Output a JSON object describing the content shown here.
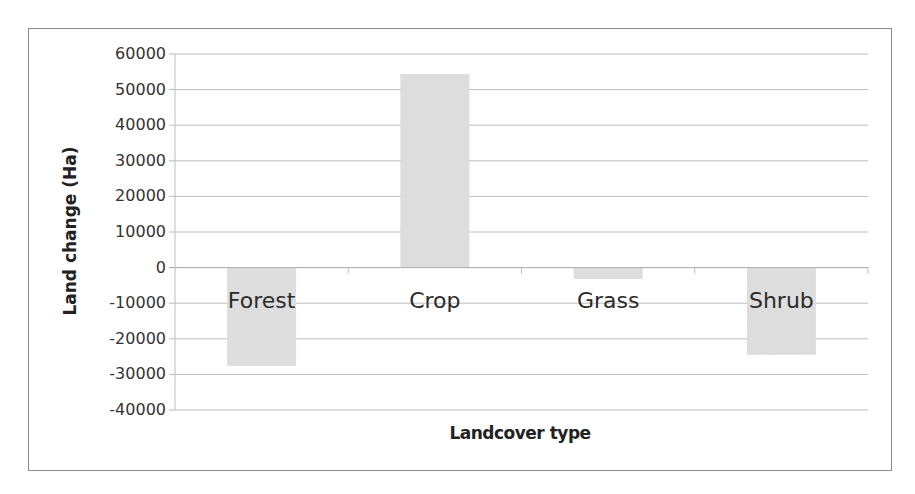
{
  "chart_data": {
    "type": "bar",
    "title": "",
    "xlabel": "Landcover type",
    "ylabel": "Land change (Ha)",
    "categories": [
      "Forest",
      "Crop",
      "Grass",
      "Shrub"
    ],
    "values": [
      -27600,
      54400,
      -3200,
      -24500
    ],
    "ylim": [
      -40000,
      60000
    ],
    "yticks": [
      60000,
      50000,
      40000,
      30000,
      20000,
      10000,
      0,
      -10000,
      -20000,
      -30000,
      -40000
    ],
    "ytick_labels": [
      "60000",
      "50000",
      "40000",
      "30000",
      "20000",
      "10000",
      "0",
      "-10000",
      "-20000",
      "-30000",
      "-40000"
    ],
    "grid": true,
    "legend": "none",
    "bar_color": "#dcdcdc"
  },
  "colors": {
    "bar": "#dcdcdc",
    "grid": "#bdbdbd",
    "border": "#8a8a8a",
    "text": "#2a2a2a"
  }
}
